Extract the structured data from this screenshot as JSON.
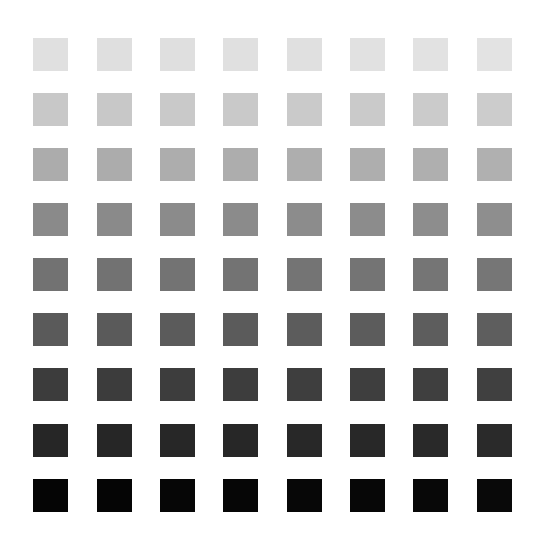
{
  "grid": {
    "rows": 9,
    "columns": 8,
    "square_size": [
      35,
      33
    ],
    "column_x": [
      33,
      97,
      160,
      223,
      287,
      350,
      413,
      477
    ],
    "row_y": [
      38,
      93,
      148,
      203,
      258,
      313,
      368,
      424,
      479
    ],
    "row_colors": [
      [
        "#e0e0e0",
        "#dfdfdf",
        "#dfdfdf",
        "#e0e0e0",
        "#e0e0e0",
        "#e1e1e1",
        "#e2e2e2",
        "#e3e3e3"
      ],
      [
        "#c8c8c8",
        "#c8c8c8",
        "#c9c9c9",
        "#c9c9c9",
        "#cacaca",
        "#cacaca",
        "#cbcbcb",
        "#cccccc"
      ],
      [
        "#acacac",
        "#acacac",
        "#adadad",
        "#adadad",
        "#aeaeae",
        "#aeaeae",
        "#afafaf",
        "#b0b0b0"
      ],
      [
        "#8a8a8a",
        "#8a8a8a",
        "#8b8b8b",
        "#8b8b8b",
        "#8c8c8c",
        "#8c8c8c",
        "#8d8d8d",
        "#8e8e8e"
      ],
      [
        "#727272",
        "#727272",
        "#737373",
        "#737373",
        "#747474",
        "#747474",
        "#757575",
        "#767676"
      ],
      [
        "#5a5a5a",
        "#5a5a5a",
        "#5b5b5b",
        "#5b5b5b",
        "#5c5c5c",
        "#5c5c5c",
        "#5d5d5d",
        "#5e5e5e"
      ],
      [
        "#3c3c3c",
        "#3c3c3c",
        "#3d3d3d",
        "#3d3d3d",
        "#3e3e3e",
        "#3e3e3e",
        "#3f3f3f",
        "#404040"
      ],
      [
        "#262626",
        "#262626",
        "#272727",
        "#272727",
        "#282828",
        "#282828",
        "#292929",
        "#2a2a2a"
      ],
      [
        "#050505",
        "#050505",
        "#060606",
        "#060606",
        "#070707",
        "#070707",
        "#080808",
        "#090909"
      ]
    ]
  }
}
